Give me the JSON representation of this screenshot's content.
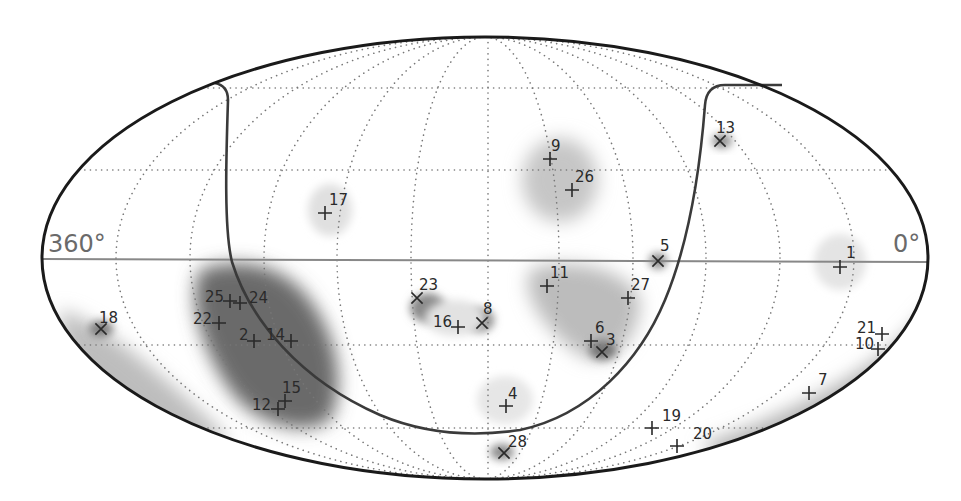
{
  "map": {
    "projection": "all-sky elliptical (Mollweide/Hammer-like)",
    "axis_labels": {
      "left": "360°",
      "right": "0°"
    },
    "colors": {
      "outline": "#1a1a1a",
      "grid": "#777777",
      "equator": "#888888",
      "marker": "#2a2a2a",
      "density": "#6e6e6e"
    },
    "sources": [
      {
        "id": "1",
        "marker": "plus",
        "x": 840,
        "y": 267,
        "lx": 846,
        "ly": 258
      },
      {
        "id": "2",
        "marker": "plus",
        "x": 254,
        "y": 341,
        "lx": 239,
        "ly": 340
      },
      {
        "id": "3",
        "marker": "cross",
        "x": 602,
        "y": 352,
        "lx": 606,
        "ly": 345
      },
      {
        "id": "4",
        "marker": "plus",
        "x": 506,
        "y": 406,
        "lx": 508,
        "ly": 399
      },
      {
        "id": "5",
        "marker": "cross",
        "x": 658,
        "y": 261,
        "lx": 660,
        "ly": 251
      },
      {
        "id": "6",
        "marker": "plus",
        "x": 591,
        "y": 341,
        "lx": 595,
        "ly": 333
      },
      {
        "id": "7",
        "marker": "plus",
        "x": 809,
        "y": 393,
        "lx": 818,
        "ly": 385
      },
      {
        "id": "8",
        "marker": "cross",
        "x": 482,
        "y": 323,
        "lx": 483,
        "ly": 314
      },
      {
        "id": "9",
        "marker": "plus",
        "x": 550,
        "y": 159,
        "lx": 551,
        "ly": 151
      },
      {
        "id": "10",
        "marker": "plus",
        "x": 878,
        "y": 349,
        "lx": 855,
        "ly": 349
      },
      {
        "id": "11",
        "marker": "plus",
        "x": 547,
        "y": 286,
        "lx": 550,
        "ly": 278
      },
      {
        "id": "12",
        "marker": "plus",
        "x": 278,
        "y": 409,
        "lx": 252,
        "ly": 410
      },
      {
        "id": "13",
        "marker": "cross",
        "x": 720,
        "y": 141,
        "lx": 716,
        "ly": 133
      },
      {
        "id": "14",
        "marker": "plus",
        "x": 291,
        "y": 341,
        "lx": 266,
        "ly": 340
      },
      {
        "id": "15",
        "marker": "plus",
        "x": 285,
        "y": 401,
        "lx": 282,
        "ly": 393
      },
      {
        "id": "16",
        "marker": "plus",
        "x": 458,
        "y": 327,
        "lx": 433,
        "ly": 327
      },
      {
        "id": "17",
        "marker": "plus",
        "x": 325,
        "y": 213,
        "lx": 329,
        "ly": 205
      },
      {
        "id": "18",
        "marker": "cross",
        "x": 101,
        "y": 329,
        "lx": 99,
        "ly": 323
      },
      {
        "id": "19",
        "marker": "plus",
        "x": 652,
        "y": 428,
        "lx": 662,
        "ly": 421
      },
      {
        "id": "20",
        "marker": "plus",
        "x": 677,
        "y": 446,
        "lx": 693,
        "ly": 439
      },
      {
        "id": "21",
        "marker": "plus",
        "x": 882,
        "y": 334,
        "lx": 857,
        "ly": 333
      },
      {
        "id": "22",
        "marker": "plus",
        "x": 219,
        "y": 323,
        "lx": 193,
        "ly": 324
      },
      {
        "id": "23",
        "marker": "cross",
        "x": 417,
        "y": 298,
        "lx": 419,
        "ly": 290
      },
      {
        "id": "24",
        "marker": "plus",
        "x": 240,
        "y": 303,
        "lx": 249,
        "ly": 303
      },
      {
        "id": "25",
        "marker": "plus",
        "x": 230,
        "y": 301,
        "lx": 205,
        "ly": 302
      },
      {
        "id": "26",
        "marker": "plus",
        "x": 572,
        "y": 190,
        "lx": 575,
        "ly": 182
      },
      {
        "id": "27",
        "marker": "plus",
        "x": 628,
        "y": 298,
        "lx": 631,
        "ly": 290
      },
      {
        "id": "28",
        "marker": "cross",
        "x": 504,
        "y": 453,
        "lx": 508,
        "ly": 447
      }
    ]
  }
}
